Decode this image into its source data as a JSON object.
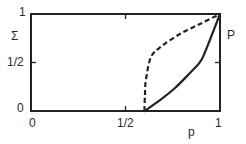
{
  "chart_data": {
    "type": "line",
    "title": "",
    "xlabel": "p",
    "ylabel": "Σ",
    "right_ylabel": "P",
    "xlim": [
      0,
      1
    ],
    "ylim": [
      0,
      1
    ],
    "grid": false,
    "legend": null,
    "x_ticks": [
      {
        "value": 0,
        "label": "0"
      },
      {
        "value": 0.5,
        "label": "1/2"
      },
      {
        "value": 1,
        "label": "1"
      }
    ],
    "y_ticks": [
      {
        "value": 0,
        "label": "0"
      },
      {
        "value": 0.5,
        "label": "1/2"
      },
      {
        "value": 1,
        "label": "1"
      }
    ],
    "series": [
      {
        "name": "P",
        "style": "solid",
        "axis": "right",
        "x": [
          0.6,
          0.683,
          0.762,
          0.841,
          0.894,
          0.921,
          1.0
        ],
        "y": [
          0.0,
          0.113,
          0.237,
          0.392,
          0.505,
          0.608,
          1.0
        ]
      },
      {
        "name": "Σ",
        "style": "dashed",
        "axis": "left",
        "x": [
          0.6,
          0.603,
          0.608,
          0.635,
          0.693,
          0.788,
          0.894,
          1.0
        ],
        "y": [
          0.0,
          0.165,
          0.32,
          0.557,
          0.67,
          0.794,
          0.897,
          1.0
        ]
      }
    ]
  },
  "labels": {
    "y_top": "1",
    "y_sigma": "Σ",
    "y_half": "1/2",
    "y_zero": "0",
    "x_zero": "0",
    "x_half": "1/2",
    "x_one": "1",
    "x_axis": "p",
    "right_axis": "P"
  },
  "colors": {
    "ink": "#222222",
    "background": "#ffffff"
  }
}
